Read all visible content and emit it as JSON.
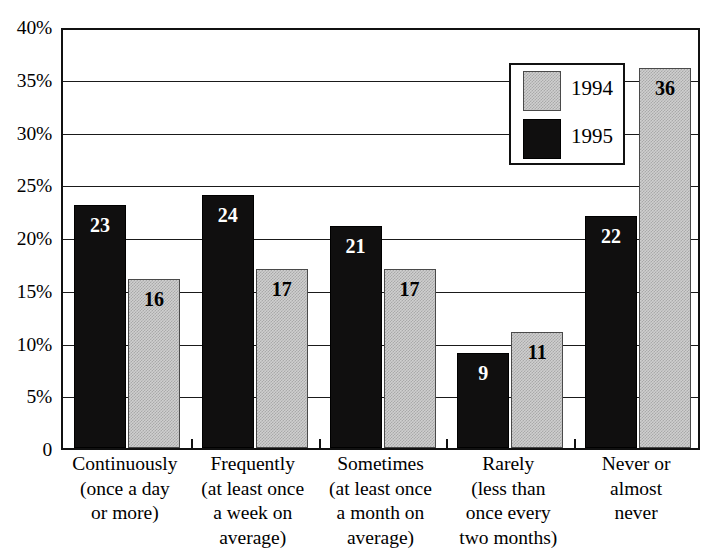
{
  "chart_data": {
    "type": "bar",
    "title": "",
    "subtitle": "",
    "xlabel": "",
    "ylabel": "",
    "ylim": [
      0,
      40
    ],
    "ytick_labels": [
      "40%",
      "35%",
      "30%",
      "25%",
      "20%",
      "15%",
      "10%",
      "5%",
      "0"
    ],
    "ytick_values": [
      40,
      35,
      30,
      25,
      20,
      15,
      10,
      5,
      0
    ],
    "grid": true,
    "legend_position": "top-center-right",
    "categories": [
      "Continuously (once a day or more)",
      "Frequently (at least once a week on average)",
      "Sometimes (at least once a month on average)",
      "Rarely (less than once every two months)",
      "Never or almost never"
    ],
    "category_lines": [
      [
        "Continuously",
        "(once a day",
        "or more)"
      ],
      [
        "Frequently",
        "(at least once",
        "a week on",
        "average)"
      ],
      [
        "Sometimes",
        "(at least once",
        "a month on",
        "average)"
      ],
      [
        "Rarely",
        "(less than",
        "once every",
        "two months)"
      ],
      [
        "Never or",
        "almost",
        "never"
      ]
    ],
    "series": [
      {
        "name": "1995",
        "color": "#100f0f",
        "fill": "solid-black",
        "label_color": "#ffffff",
        "values": [
          23,
          24,
          21,
          9,
          22
        ],
        "value_labels": [
          "23",
          "24",
          "21",
          "9",
          "22"
        ]
      },
      {
        "name": "1994",
        "color": "#cfcfcf",
        "fill": "gray-stipple",
        "label_color": "#000000",
        "values": [
          16,
          17,
          17,
          11,
          36
        ],
        "value_labels": [
          "16",
          "17",
          "17",
          "11",
          "36"
        ]
      }
    ],
    "series_draw_order": [
      "1995",
      "1994"
    ],
    "legend_entries": [
      {
        "label": "1994",
        "swatch": "gray-stipple"
      },
      {
        "label": "1995",
        "swatch": "solid-black"
      }
    ],
    "annotations": []
  },
  "colors": {
    "axis": "#111111",
    "grid": "#1a1a1a",
    "background": "#ffffff",
    "series_1995": "#100f0f",
    "series_1994": "#cfcfcf"
  },
  "scan_artifact": {
    "top_sliver_text": ""
  }
}
